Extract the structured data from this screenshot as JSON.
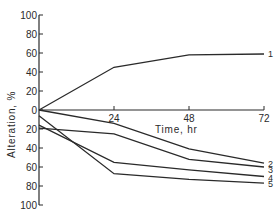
{
  "chart_data": {
    "type": "line",
    "title": "",
    "xlabel": "Time, hr",
    "ylabel": "Alteration, %",
    "x": [
      0,
      24,
      48,
      72
    ],
    "xticks": [
      "24",
      "48",
      "72"
    ],
    "yticks_upper": [
      "100",
      "80",
      "60",
      "40",
      "20",
      "0"
    ],
    "yticks_lower": [
      "20",
      "40",
      "60",
      "80",
      "100"
    ],
    "ylim": [
      -100,
      100
    ],
    "xlim": [
      0,
      72
    ],
    "grid": false,
    "legend": "inline numeric labels at right end of each line",
    "series": [
      {
        "name": "1",
        "values": [
          0,
          45,
          58,
          59
        ]
      },
      {
        "name": "2",
        "values": [
          0,
          -14,
          -41,
          -56
        ]
      },
      {
        "name": "3",
        "values": [
          -19,
          -25,
          -52,
          -60
        ]
      },
      {
        "name": "4",
        "values": [
          -16,
          -55,
          -63,
          -70
        ]
      },
      {
        "name": "5",
        "values": [
          -6,
          -67,
          -73,
          -77
        ]
      }
    ],
    "line_color": "#2a2a2a"
  }
}
